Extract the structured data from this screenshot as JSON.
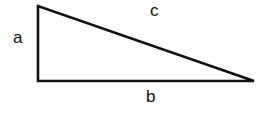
{
  "diagram": {
    "type": "right-triangle",
    "labels": {
      "a": "a",
      "b": "b",
      "c": "c"
    },
    "vertices": {
      "top": [
        38,
        6
      ],
      "right_angle": [
        38,
        81
      ],
      "right": [
        254,
        81
      ]
    },
    "stroke_color": "#111111",
    "background": "#ffffff"
  }
}
